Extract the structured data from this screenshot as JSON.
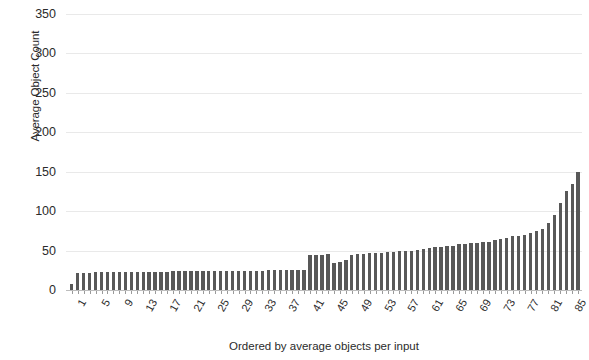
{
  "chart_data": {
    "type": "bar",
    "title": "",
    "xlabel": "Ordered by average objects per input",
    "ylabel": "Average Object Count",
    "ylim": [
      0,
      350
    ],
    "yticks": [
      0,
      50,
      100,
      150,
      200,
      250,
      300,
      350
    ],
    "ytick_labels": [
      "0",
      "50",
      "100",
      "150",
      "200",
      "250",
      "300",
      "350"
    ],
    "grid": true,
    "legend": null,
    "bar_color": "#585858",
    "xtick_labels": [
      "1",
      "5",
      "9",
      "13",
      "17",
      "21",
      "25",
      "29",
      "33",
      "37",
      "41",
      "45",
      "49",
      "53",
      "57",
      "61",
      "65",
      "69",
      "73",
      "77",
      "81",
      "85"
    ],
    "xtick_positions": [
      1,
      5,
      9,
      13,
      17,
      21,
      25,
      29,
      33,
      37,
      41,
      45,
      49,
      53,
      57,
      61,
      65,
      69,
      73,
      77,
      81,
      85
    ],
    "categories": [
      1,
      2,
      3,
      4,
      5,
      6,
      7,
      8,
      9,
      10,
      11,
      12,
      13,
      14,
      15,
      16,
      17,
      18,
      19,
      20,
      21,
      22,
      23,
      24,
      25,
      26,
      27,
      28,
      29,
      30,
      31,
      32,
      33,
      34,
      35,
      36,
      37,
      38,
      39,
      40,
      41,
      42,
      43,
      44,
      45,
      46,
      47,
      48,
      49,
      50,
      51,
      52,
      53,
      54,
      55,
      56,
      57,
      58,
      59,
      60,
      61,
      62,
      63,
      64,
      65,
      66,
      67,
      68,
      69,
      70,
      71,
      72,
      73,
      74,
      75,
      76,
      77,
      78,
      79,
      80,
      81,
      82,
      83,
      84,
      85,
      86
    ],
    "values": [
      8,
      22,
      22,
      22,
      23,
      23,
      23,
      23,
      23,
      23,
      23,
      23,
      23,
      23,
      23,
      23,
      23,
      24,
      24,
      24,
      24,
      24,
      24,
      24,
      24,
      24,
      24,
      24,
      24,
      24,
      24,
      24,
      24,
      25,
      25,
      25,
      25,
      25,
      26,
      26,
      44,
      45,
      45,
      46,
      34,
      36,
      38,
      44,
      46,
      46,
      47,
      47,
      47,
      48,
      48,
      49,
      50,
      50,
      51,
      52,
      53,
      55,
      55,
      56,
      56,
      58,
      58,
      60,
      60,
      61,
      61,
      63,
      65,
      66,
      68,
      69,
      70,
      72,
      75,
      78,
      85,
      95,
      110,
      125,
      135,
      150
    ]
  }
}
